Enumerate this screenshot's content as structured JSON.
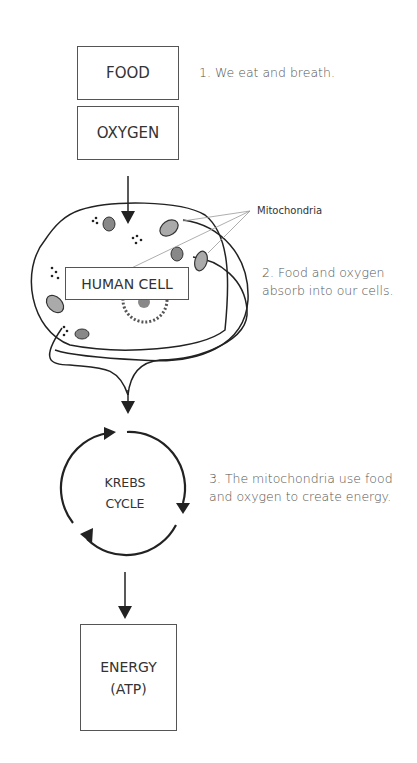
{
  "steps": {
    "food": "FOOD",
    "oxygen": "OXYGEN",
    "human_cell": "HUMAN CELL",
    "krebs_line1": "KREBS",
    "krebs_line2": "CYCLE",
    "energy_line1": "ENERGY",
    "energy_line2": "(ATP)"
  },
  "labels": {
    "mitochondria": "Mitochondria"
  },
  "notes": {
    "step1": "1. We eat and breath.",
    "step2_line1": "2. Food and oxygen",
    "step2_line2": "absorb into our cells.",
    "step3_line1": "3. The mitochondria use food",
    "step3_line2": "and oxygen to create energy."
  }
}
